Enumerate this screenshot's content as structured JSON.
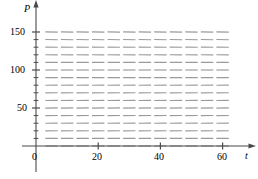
{
  "figure": {
    "kind": "slope-field",
    "background_color": "#ffffff",
    "segment_color": "#8a8a8a",
    "axis_color": "#4a4a4a",
    "width": 258,
    "height": 179
  },
  "axes": {
    "x_axis": {
      "name": "t",
      "tick_labels": [
        "0",
        "20",
        "40",
        "60"
      ],
      "tick_values": [
        0,
        20,
        40,
        60
      ],
      "min": 0,
      "max": 64,
      "minor_tick_step": 5
    },
    "y_axis": {
      "name": "P",
      "tick_labels": [
        "50",
        "100",
        "150"
      ],
      "tick_values": [
        50,
        100,
        150
      ],
      "min": 0,
      "max": 160,
      "minor_tick_step": 10
    },
    "origin_label": "0"
  },
  "chart_data": {
    "type": "scatter",
    "title": "",
    "xlabel": "t",
    "ylabel": "P",
    "xlim": [
      0,
      64
    ],
    "ylim": [
      0,
      160
    ],
    "grid": false,
    "legend": null,
    "carrying_capacity": 100,
    "equilibria": [
      0,
      100
    ],
    "slope_rule": {
      "form": "dP/dt = k*P*(1 - P/C)",
      "k": 0.0016,
      "C": 100
    },
    "sample_grid": {
      "t_values": [
        5,
        10,
        15,
        20,
        25,
        30,
        35,
        40,
        45,
        50,
        55,
        60
      ],
      "P_values": [
        0,
        10,
        20,
        30,
        40,
        50,
        60,
        70,
        80,
        90,
        100,
        110,
        120,
        130,
        140,
        150
      ],
      "slopes_by_P": [
        0.0,
        0.144,
        0.256,
        0.336,
        0.384,
        0.4,
        0.384,
        0.336,
        0.256,
        0.144,
        0.0,
        -0.176,
        -0.384,
        -0.624,
        -0.896,
        -1.2
      ]
    }
  }
}
